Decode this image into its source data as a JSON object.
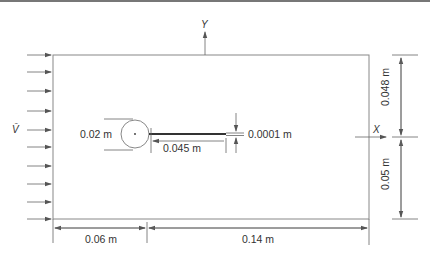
{
  "diagram": {
    "type": "flow-domain-schematic",
    "colors": {
      "line": "#888888",
      "dimension": "#666666",
      "text": "#333333",
      "plate": "#333333",
      "top_rule": "#777777"
    },
    "inflow": {
      "label": "V̄",
      "arrow_count": 11
    },
    "axes": {
      "x_label": "X",
      "y_label": "Y"
    },
    "cylinder": {
      "diameter_label": "0.02 m"
    },
    "plate": {
      "length_label": "0.045 m",
      "thickness_label": "0.0001 m"
    },
    "dimensions": {
      "upstream": "0.06 m",
      "downstream": "0.14 m",
      "top_height": "0.048 m",
      "bottom_height": "0.05 m"
    }
  }
}
